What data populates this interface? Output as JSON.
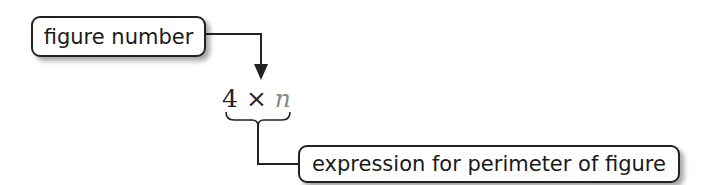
{
  "labels": {
    "top": "figure number",
    "bottom": "expression for perimeter of figure"
  },
  "expression": {
    "coefficient": "4",
    "operator": "×",
    "variable": "n"
  },
  "colors": {
    "line": "#222222",
    "variable": "#888888"
  }
}
